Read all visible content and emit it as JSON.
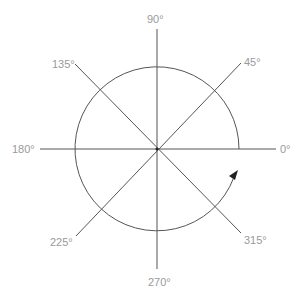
{
  "diagram": {
    "type": "angle-circle",
    "center": [
      157,
      149
    ],
    "radius": 82,
    "line_color": "#555555",
    "label_color": "#9a9a9a",
    "labels": [
      {
        "angle": 0,
        "text": "0°"
      },
      {
        "angle": 45,
        "text": "45°"
      },
      {
        "angle": 90,
        "text": "90°"
      },
      {
        "angle": 135,
        "text": "135°"
      },
      {
        "angle": 180,
        "text": "180°"
      },
      {
        "angle": 225,
        "text": "225°"
      },
      {
        "angle": 270,
        "text": "270°"
      },
      {
        "angle": 315,
        "text": "315°"
      }
    ],
    "arrow": {
      "direction": "counterclockwise",
      "near_angle": 340
    }
  }
}
